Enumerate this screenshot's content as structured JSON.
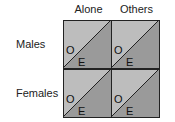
{
  "columns": [
    "Alone",
    "Others"
  ],
  "rows": [
    "Males",
    "Females"
  ],
  "cells": [
    {
      "row": "Males",
      "col": "Alone",
      "upper_label": "O",
      "lower_label": "E"
    },
    {
      "row": "Males",
      "col": "Others",
      "upper_label": "O",
      "lower_label": "E"
    },
    {
      "row": "Females",
      "col": "Alone",
      "upper_label": "O",
      "lower_label": "E"
    },
    {
      "row": "Females",
      "col": "Others",
      "upper_label": "O",
      "lower_label": "E"
    }
  ],
  "colors": {
    "upper_triangle": "#bdbdbd",
    "lower_triangle": "#9a9a9a",
    "line": "#222222"
  }
}
